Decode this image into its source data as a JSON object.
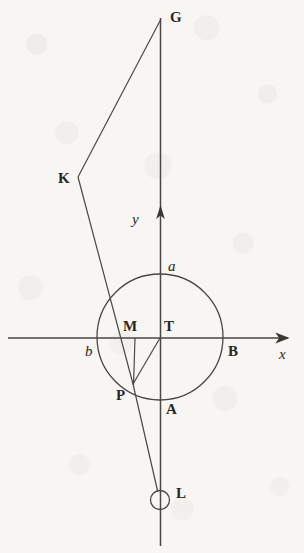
{
  "figure": {
    "kind": "geometry-diagram",
    "width": 304,
    "height": 553,
    "background_color": "#f7f6f3",
    "ink_color": "#3a3733"
  },
  "axes": {
    "x_axis": {
      "label": "x",
      "label_x": 280,
      "label_y": 349,
      "y": 338,
      "x_start": 8,
      "x_end": 293,
      "arrow": "right"
    },
    "y_axis": {
      "label": "y",
      "label_x": 133,
      "label_y": 214,
      "x": 160,
      "y_top": 18,
      "y_bottom": 546,
      "arrow_tip_y": 206,
      "arrow": "up"
    },
    "origin": {
      "x": 160,
      "y": 338
    }
  },
  "circle": {
    "center_x": 160,
    "center_y": 337,
    "radius": 63
  },
  "small_circle_L": {
    "center_x": 160,
    "center_y": 500,
    "radius": 9
  },
  "points": [
    {
      "id": "G",
      "label": "G",
      "style": "bold",
      "x": 161,
      "y": 19,
      "label_x": 170,
      "label_y": 10
    },
    {
      "id": "K",
      "label": "K",
      "style": "bold",
      "x": 78,
      "y": 177,
      "label_x": 58,
      "label_y": 171
    },
    {
      "id": "a",
      "label": "a",
      "style": "italic",
      "x": 160,
      "y": 274,
      "label_x": 168,
      "label_y": 259
    },
    {
      "id": "M",
      "label": "M",
      "style": "bold",
      "x": 135,
      "y": 338,
      "label_x": 123,
      "label_y": 319
    },
    {
      "id": "T",
      "label": "T",
      "style": "bold",
      "x": 160,
      "y": 338,
      "label_x": 163,
      "label_y": 319
    },
    {
      "id": "b",
      "label": "b",
      "style": "italic",
      "x": 97,
      "y": 338,
      "label_x": 85,
      "label_y": 344
    },
    {
      "id": "B",
      "label": "B",
      "style": "bold",
      "x": 223,
      "y": 338,
      "label_x": 228,
      "label_y": 344
    },
    {
      "id": "P",
      "label": "P",
      "style": "bold",
      "x": 133,
      "y": 384,
      "label_x": 116,
      "label_y": 388
    },
    {
      "id": "A",
      "label": "A",
      "style": "bold",
      "x": 160,
      "y": 400,
      "label_x": 166,
      "label_y": 402
    },
    {
      "id": "L",
      "label": "L",
      "style": "bold",
      "x": 160,
      "y": 500,
      "label_x": 176,
      "label_y": 486
    }
  ],
  "segments": [
    {
      "id": "G-K",
      "from": "G",
      "to": "K",
      "x1": 161,
      "y1": 19,
      "x2": 78,
      "y2": 177
    },
    {
      "id": "K-P",
      "from": "K",
      "to": "P",
      "x1": 78,
      "y1": 177,
      "x2": 133,
      "y2": 384
    },
    {
      "id": "M-P",
      "from": "M",
      "to": "P",
      "x1": 135,
      "y1": 338,
      "x2": 133,
      "y2": 384
    },
    {
      "id": "T-P",
      "from": "T",
      "to": "P",
      "x1": 160,
      "y1": 338,
      "x2": 133,
      "y2": 384
    },
    {
      "id": "P-L",
      "from": "P",
      "to": "L",
      "x1": 133,
      "y1": 384,
      "x2": 158,
      "y2": 492
    }
  ]
}
